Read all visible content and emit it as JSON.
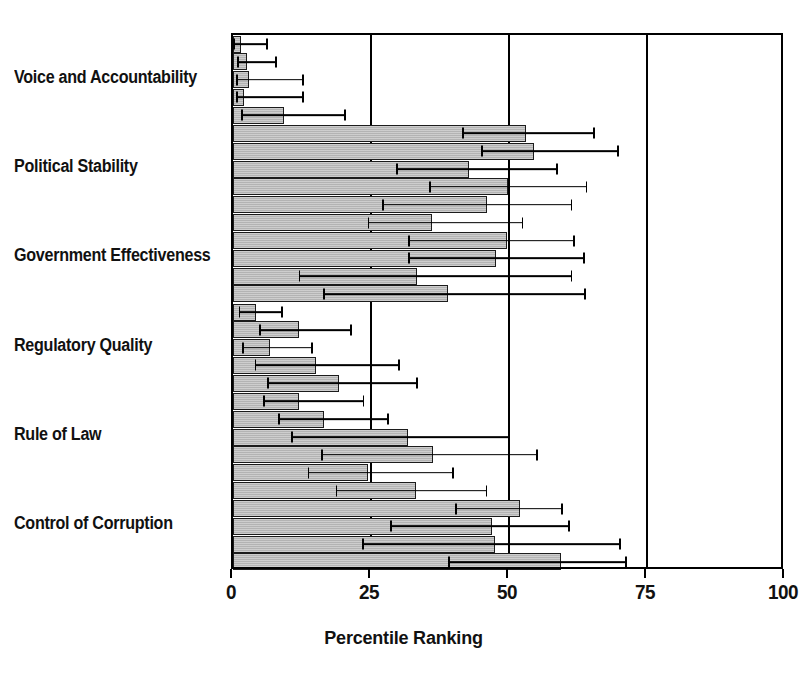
{
  "chart_data": {
    "type": "bar",
    "title": "",
    "xlabel": "Percentile Ranking",
    "ylabel": "",
    "orientation": "horizontal",
    "xlim": [
      0,
      100
    ],
    "xticks": [
      0,
      25,
      50,
      75,
      100
    ],
    "xticklabels": [
      "0",
      "25",
      "50",
      "75",
      "100"
    ],
    "grid": true,
    "legend": false,
    "error_bars": "horizontal whisker with caps, asymmetric 90% confidence interval",
    "bar_color": "#b3b3b3",
    "bar_edge_color": "#1c1c1c",
    "error_color": "#000000",
    "categories": [
      "Voice and Accountability",
      "Political Stability",
      "Government Effectiveness",
      "Regulatory Quality",
      "Rule of Law",
      "Control of Corruption"
    ],
    "bars_per_category": 5,
    "groups": [
      {
        "category": "Voice and Accountability",
        "bars": [
          {
            "value": 1.4,
            "ci_low": 0.0,
            "ci_high": 6.3
          },
          {
            "value": 2.5,
            "ci_low": 0.8,
            "ci_high": 7.9
          },
          {
            "value": 2.9,
            "ci_low": 0.6,
            "ci_high": 12.8
          },
          {
            "value": 2.0,
            "ci_low": 0.5,
            "ci_high": 12.8
          },
          {
            "value": 9.3,
            "ci_low": 1.5,
            "ci_high": 20.4
          }
        ]
      },
      {
        "category": "Political Stability",
        "bars": [
          {
            "value": 53.0,
            "ci_low": 41.5,
            "ci_high": 65.5
          },
          {
            "value": 54.6,
            "ci_low": 45.0,
            "ci_high": 69.9
          },
          {
            "value": 42.8,
            "ci_low": 29.5,
            "ci_high": 58.8
          },
          {
            "value": 49.9,
            "ci_low": 35.5,
            "ci_high": 64.2
          },
          {
            "value": 46.0,
            "ci_low": 27.0,
            "ci_high": 61.5
          }
        ]
      },
      {
        "category": "Government Effectiveness",
        "bars": [
          {
            "value": 36.1,
            "ci_low": 24.4,
            "ci_high": 52.6
          },
          {
            "value": 49.7,
            "ci_low": 31.7,
            "ci_high": 62.0
          },
          {
            "value": 47.7,
            "ci_low": 31.7,
            "ci_high": 63.8
          },
          {
            "value": 33.4,
            "ci_low": 11.9,
            "ci_high": 61.5
          },
          {
            "value": 38.9,
            "ci_low": 16.3,
            "ci_high": 64.0
          }
        ]
      },
      {
        "category": "Regulatory Quality",
        "bars": [
          {
            "value": 4.2,
            "ci_low": 1.0,
            "ci_high": 9.0
          },
          {
            "value": 11.9,
            "ci_low": 4.7,
            "ci_high": 21.5
          },
          {
            "value": 6.7,
            "ci_low": 1.6,
            "ci_high": 14.5
          },
          {
            "value": 15.0,
            "ci_low": 3.9,
            "ci_high": 30.3
          },
          {
            "value": 19.2,
            "ci_low": 6.2,
            "ci_high": 33.5
          }
        ]
      },
      {
        "category": "Rule of Law",
        "bars": [
          {
            "value": 11.9,
            "ci_low": 5.5,
            "ci_high": 23.8
          },
          {
            "value": 16.5,
            "ci_low": 8.2,
            "ci_high": 28.3
          },
          {
            "value": 31.7,
            "ci_low": 10.5,
            "ci_high": 50.2
          },
          {
            "value": 36.2,
            "ci_low": 16.0,
            "ci_high": 55.2
          },
          {
            "value": 24.4,
            "ci_low": 13.5,
            "ci_high": 40.0
          }
        ]
      },
      {
        "category": "Control of Corruption",
        "bars": [
          {
            "value": 33.1,
            "ci_low": 18.6,
            "ci_high": 46.1
          },
          {
            "value": 52.0,
            "ci_low": 40.3,
            "ci_high": 59.7
          },
          {
            "value": 47.0,
            "ci_low": 28.4,
            "ci_high": 61.0
          },
          {
            "value": 47.4,
            "ci_low": 23.4,
            "ci_high": 70.3
          },
          {
            "value": 59.4,
            "ci_low": 38.9,
            "ci_high": 71.4
          }
        ]
      }
    ]
  }
}
